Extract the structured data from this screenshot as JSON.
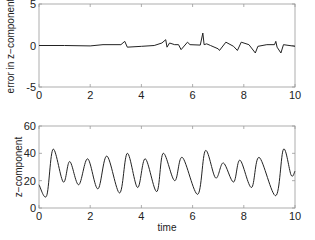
{
  "chart_data": [
    {
      "type": "line",
      "title": "",
      "xlabel": "",
      "ylabel": "error in z−component",
      "xlim": [
        0,
        10
      ],
      "ylim": [
        -5,
        5
      ],
      "xticks": [
        "0",
        "2",
        "4",
        "6",
        "8",
        "10"
      ],
      "yticks": [
        "-5",
        "0",
        "5"
      ],
      "grid": false,
      "line_color": "#222222",
      "series": [
        {
          "name": "error",
          "x": [
            0,
            1,
            2,
            2.5,
            3.2,
            3.35,
            3.45,
            4,
            4.5,
            4.8,
            4.95,
            5.0,
            5.1,
            5.3,
            5.45,
            5.55,
            5.8,
            5.9,
            6.3,
            6.4,
            6.45,
            6.55,
            6.7,
            7.0,
            7.05,
            7.3,
            7.6,
            7.75,
            7.9,
            8.2,
            8.45,
            8.55,
            8.9,
            9.2,
            9.25,
            9.3,
            9.45,
            9.55,
            10
          ],
          "values": [
            0,
            0,
            -0.05,
            0.1,
            0.1,
            0.5,
            -0.2,
            -0.1,
            0,
            0.3,
            0.7,
            -0.2,
            0.3,
            0.1,
            0.1,
            -0.5,
            0.4,
            0.1,
            0.05,
            1.5,
            0.1,
            0.2,
            0,
            -0.4,
            -0.6,
            0.4,
            -0.1,
            -0.6,
            0.4,
            0.1,
            -0.9,
            -0.1,
            0.1,
            0.1,
            0.5,
            -0.2,
            -0.9,
            0.1,
            -0.1
          ]
        }
      ]
    },
    {
      "type": "line",
      "title": "",
      "xlabel": "time",
      "ylabel": "z−component",
      "xlim": [
        0,
        10
      ],
      "ylim": [
        0,
        60
      ],
      "xticks": [
        "0",
        "2",
        "4",
        "6",
        "8",
        "10"
      ],
      "yticks": [
        "0",
        "20",
        "40",
        "60"
      ],
      "grid": false,
      "line_color": "#222222",
      "series": [
        {
          "name": "z",
          "x": [
            0,
            0.3,
            0.55,
            0.95,
            1.2,
            1.55,
            1.9,
            2.3,
            2.65,
            3.15,
            3.45,
            3.85,
            4.15,
            4.6,
            4.85,
            5.3,
            5.6,
            6.2,
            6.5,
            6.9,
            7.2,
            7.6,
            7.85,
            8.3,
            8.6,
            9.25,
            9.55,
            9.85,
            10
          ],
          "values": [
            17,
            9,
            43,
            19,
            34,
            17,
            36,
            14,
            38,
            11,
            40,
            15,
            36,
            12,
            40,
            20,
            37,
            10,
            42,
            22,
            33,
            19,
            35,
            15,
            37,
            9,
            43,
            24,
            27
          ]
        }
      ]
    }
  ]
}
